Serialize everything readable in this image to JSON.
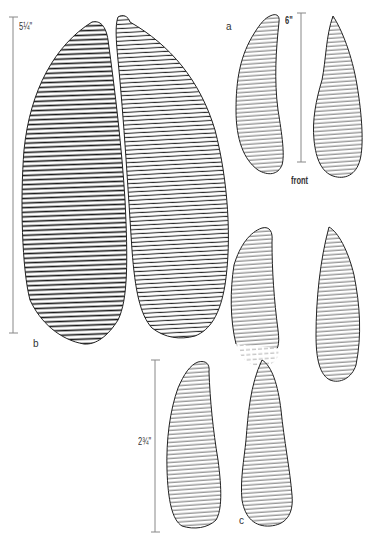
{
  "figure": {
    "colors": {
      "ink": "#1a1a1a",
      "scale_line": "#888888",
      "background": "#ffffff"
    },
    "groups": [
      {
        "id": "a",
        "label": "a",
        "scale_label": "6\"",
        "caption": "front"
      },
      {
        "id": "b",
        "label": "b",
        "scale_label": "5¼\""
      },
      {
        "id": "c",
        "label": "c",
        "scale_label": "2¾\""
      }
    ]
  }
}
